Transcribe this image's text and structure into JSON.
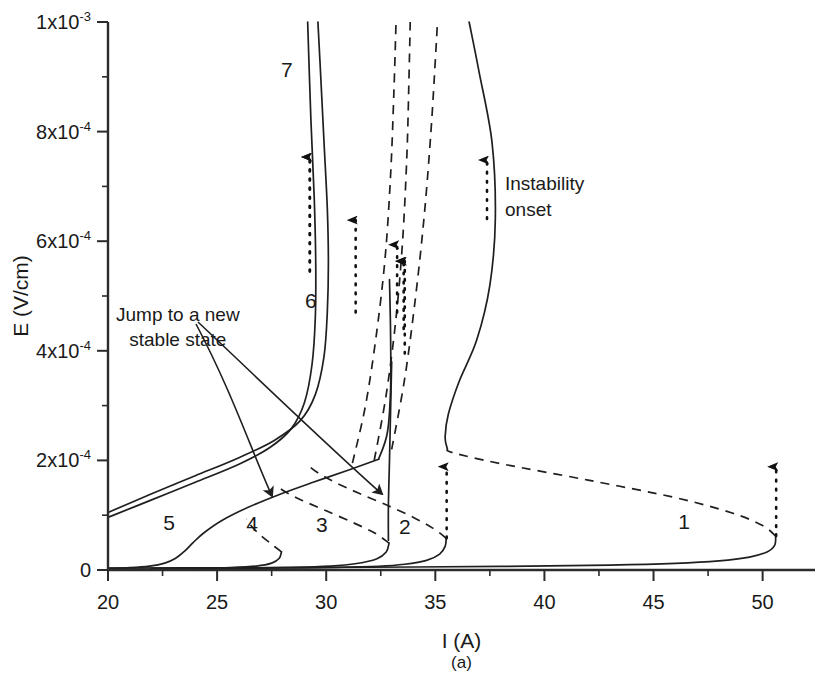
{
  "chart_data": {
    "type": "line",
    "title": "",
    "caption": "(a)",
    "xlabel": "I (A)",
    "ylabel": "E (V/cm)",
    "xlim": [
      20,
      52.4
    ],
    "ylim": [
      0,
      0.001
    ],
    "grid": false,
    "x_ticks": [
      {
        "value": 20,
        "label": "20"
      },
      {
        "value": 25,
        "label": "25"
      },
      {
        "value": 30,
        "label": "30"
      },
      {
        "value": 35,
        "label": "35"
      },
      {
        "value": 40,
        "label": "40"
      },
      {
        "value": 45,
        "label": "45"
      },
      {
        "value": 50,
        "label": "50"
      }
    ],
    "x_minor_ticks": [
      22.5,
      27.5,
      32.5,
      37.5,
      42.5,
      47.5
    ],
    "y_ticks": [
      {
        "value": 0.0,
        "mantissa": "0",
        "exponent": ""
      },
      {
        "value": 0.0002,
        "mantissa": "2x10",
        "exponent": "-4"
      },
      {
        "value": 0.0004,
        "mantissa": "4x10",
        "exponent": "-4"
      },
      {
        "value": 0.0006,
        "mantissa": "6x10",
        "exponent": "-4"
      },
      {
        "value": 0.0008,
        "mantissa": "8x10",
        "exponent": "-4"
      },
      {
        "value": 0.001,
        "mantissa": "1x10",
        "exponent": "-3"
      }
    ],
    "y_minor_ticks": [
      0.0001,
      0.0003,
      0.0005,
      0.0007,
      0.0009
    ],
    "legend": {
      "position": "inside-top-right",
      "entries": [
        {
          "marker": "dotted-up-arrow",
          "line1": "Instability",
          "line2": "onset"
        }
      ]
    },
    "annotations": [
      {
        "name": "jump-note",
        "line1": "Jump to a new",
        "line2": "stable state",
        "x": 23.2,
        "y": 0.000455
      }
    ],
    "curve_labels": [
      {
        "label": "7",
        "x": 28.2,
        "y": 0.0009
      },
      {
        "label": "6",
        "x": 29.3,
        "y": 0.000478
      },
      {
        "label": "5",
        "x": 22.8,
        "y": 7.35e-05
      },
      {
        "label": "4",
        "x": 26.6,
        "y": 7.05e-05
      },
      {
        "label": "3",
        "x": 29.8,
        "y": 6.9e-05
      },
      {
        "label": "2",
        "x": 33.6,
        "y": 6.6e-05
      },
      {
        "label": "1",
        "x": 46.4,
        "y": 7.4e-05
      }
    ],
    "series": [
      {
        "name": "1",
        "stable_branch": [
          [
            20.0,
            3.5e-06
          ],
          [
            26.0,
            4e-06
          ],
          [
            32.0,
            5e-06
          ],
          [
            38.0,
            6.5e-06
          ],
          [
            43.0,
            9e-06
          ],
          [
            46.0,
            1.2e-05
          ],
          [
            48.0,
            1.65e-05
          ],
          [
            49.4,
            2.35e-05
          ],
          [
            50.2,
            3.3e-05
          ],
          [
            50.55,
            4.5e-05
          ],
          [
            50.6,
            6.2e-05
          ]
        ],
        "unstable_branch": [
          [
            50.6,
            6.2e-05
          ],
          [
            50.0,
            8.1e-05
          ],
          [
            48.6,
            0.000104
          ],
          [
            46.0,
            0.000132
          ],
          [
            42.0,
            0.000164
          ],
          [
            38.0,
            0.000194
          ],
          [
            35.8,
            0.000214
          ],
          [
            35.55,
            0.000221
          ]
        ],
        "upper_branch": [
          [
            35.55,
            0.000221
          ],
          [
            35.45,
            0.000243
          ],
          [
            35.6,
            0.000285
          ],
          [
            36.1,
            0.000345
          ],
          [
            36.9,
            0.00042
          ],
          [
            37.5,
            0.00052
          ],
          [
            37.75,
            0.00064
          ],
          [
            37.6,
            0.00078
          ],
          [
            37.0,
            0.00091
          ],
          [
            36.55,
            0.001
          ]
        ],
        "instability_arrow": {
          "x": 50.62,
          "y_start": 6.2e-05,
          "y_end": 0.000205
        }
      },
      {
        "name": "2",
        "stable_branch": [
          [
            25.6,
            3e-06
          ],
          [
            28.0,
            3.7e-06
          ],
          [
            30.5,
            4.8e-06
          ],
          [
            32.4,
            6.8e-06
          ],
          [
            33.6,
            1.05e-05
          ],
          [
            34.6,
            1.75e-05
          ],
          [
            35.2,
            2.9e-05
          ],
          [
            35.45,
            4.3e-05
          ],
          [
            35.5,
            5.8e-05
          ]
        ],
        "unstable_branch": [
          [
            35.5,
            5.8e-05
          ],
          [
            34.9,
            7.6e-05
          ],
          [
            34.0,
            9.6e-05
          ],
          [
            32.8,
            0.000118
          ],
          [
            31.5,
            0.00014
          ],
          [
            30.4,
            0.00016
          ],
          [
            29.6,
            0.000178
          ],
          [
            29.2,
            0.00019
          ]
        ],
        "upper_branch": [
          [
            32.85,
            5.45e-05
          ],
          [
            32.85,
            0.000118
          ],
          [
            32.9,
            0.0002
          ],
          [
            32.95,
            0.00029
          ],
          [
            33.0,
            0.00038
          ]
        ],
        "instability_arrow": {
          "x": 35.52,
          "y_start": 5.8e-05,
          "y_end": 0.000205
        }
      },
      {
        "name": "3",
        "stable_branch": [
          [
            23.4,
            3e-06
          ],
          [
            26.0,
            3.6e-06
          ],
          [
            28.4,
            4.8e-06
          ],
          [
            30.2,
            7.2e-06
          ],
          [
            31.4,
            1.18e-05
          ],
          [
            32.3,
            2e-05
          ],
          [
            32.75,
            3.3e-05
          ],
          [
            32.88,
            4.9e-05
          ]
        ],
        "unstable_branch": [
          [
            32.88,
            4.9e-05
          ],
          [
            32.2,
            6.8e-05
          ],
          [
            31.2,
            8.7e-05
          ],
          [
            30.0,
            0.000108
          ],
          [
            28.9,
            0.000127
          ],
          [
            28.2,
            0.000141
          ],
          [
            27.85,
            0.00015
          ]
        ],
        "instability_arrow": {
          "x": 33.25,
          "y_start": 0.00047,
          "y_end": 0.00061
        }
      },
      {
        "name": "4",
        "stable_branch": [
          [
            22.0,
            2.8e-06
          ],
          [
            24.0,
            3.4e-06
          ],
          [
            25.6,
            4.6e-06
          ],
          [
            26.8,
            7.2e-06
          ],
          [
            27.5,
            1.25e-05
          ],
          [
            27.85,
            2.15e-05
          ],
          [
            27.95,
            3.3e-05
          ]
        ],
        "unstable_branch": [
          [
            27.95,
            3.3e-05
          ],
          [
            27.5,
            4.7e-05
          ],
          [
            27.0,
            6.3e-05
          ],
          [
            26.6,
            7.9e-05
          ],
          [
            26.35,
            9.3e-05
          ]
        ],
        "instability_arrow": {
          "x": 31.35,
          "y_start": 0.00047,
          "y_end": 0.000655
        }
      },
      {
        "name": "5",
        "stable_branch": [
          [
            20.0,
            3e-06
          ],
          [
            21.0,
            4.2e-06
          ],
          [
            21.9,
            7e-06
          ],
          [
            22.6,
            1.25e-05
          ],
          [
            23.1,
            2.15e-05
          ],
          [
            23.5,
            3.4e-05
          ],
          [
            23.9,
            5e-05
          ],
          [
            24.4,
            6.8e-05
          ],
          [
            25.2,
            9e-05
          ],
          [
            26.4,
            0.000114
          ],
          [
            27.8,
            0.000137
          ],
          [
            29.4,
            0.00016
          ],
          [
            31.0,
            0.000182
          ],
          [
            32.4,
            0.000202
          ]
        ],
        "upper_branch": [
          [
            32.4,
            0.000202
          ],
          [
            32.8,
            0.00025
          ],
          [
            32.95,
            0.00033
          ],
          [
            32.95,
            0.00043
          ],
          [
            32.9,
            0.00053
          ]
        ],
        "instability_arrow": {
          "x": 33.55,
          "y_start": 0.00044,
          "y_end": 0.00058
        }
      },
      {
        "name": "6",
        "stable_branch": [
          [
            20.0,
            0.000105
          ],
          [
            22.0,
            0.000139
          ],
          [
            24.0,
            0.000172
          ],
          [
            26.0,
            0.000205
          ],
          [
            27.6,
            0.000236
          ],
          [
            28.8,
            0.000272
          ],
          [
            29.5,
            0.00032
          ],
          [
            29.9,
            0.00039
          ],
          [
            30.05,
            0.00047
          ],
          [
            30.1,
            0.00056
          ],
          [
            30.05,
            0.00066
          ],
          [
            29.9,
            0.00078
          ],
          [
            29.75,
            0.0009
          ],
          [
            29.62,
            0.001
          ]
        ],
        "instability_arrow": {
          "x": 29.25,
          "y_start": 0.000545,
          "y_end": 0.00077
        }
      },
      {
        "name": "7",
        "stable_branch": [
          [
            20.0,
            9.6e-05
          ],
          [
            22.0,
            0.000128
          ],
          [
            24.0,
            0.00016
          ],
          [
            26.0,
            0.000193
          ],
          [
            27.4,
            0.000223
          ],
          [
            28.4,
            0.000258
          ],
          [
            29.0,
            0.000305
          ],
          [
            29.35,
            0.000375
          ],
          [
            29.5,
            0.00046
          ],
          [
            29.52,
            0.00056
          ],
          [
            29.45,
            0.00068
          ],
          [
            29.3,
            0.00082
          ],
          [
            29.15,
            0.001
          ]
        ],
        "instability_arrow": {
          "x": 29.25,
          "y_start": 0.000545,
          "y_end": 0.00077
        }
      },
      {
        "name": "dashed-rising-a",
        "dashed_only": [
          [
            31.2,
            0.000195
          ],
          [
            31.8,
            0.0003
          ],
          [
            32.3,
            0.00043
          ],
          [
            32.7,
            0.00057
          ],
          [
            32.95,
            0.00072
          ],
          [
            33.1,
            0.00087
          ],
          [
            33.2,
            0.001
          ]
        ]
      },
      {
        "name": "dashed-rising-b",
        "dashed_only": [
          [
            32.2,
            0.0002
          ],
          [
            32.75,
            0.00032
          ],
          [
            33.2,
            0.00046
          ],
          [
            33.5,
            0.0006
          ],
          [
            33.7,
            0.00076
          ],
          [
            33.8,
            0.00091
          ],
          [
            33.85,
            0.001
          ]
        ]
      },
      {
        "name": "dashed-rising-c",
        "dashed_only": [
          [
            33.0,
            0.00022
          ],
          [
            33.6,
            0.00035
          ],
          [
            34.1,
            0.0005
          ],
          [
            34.5,
            0.00065
          ],
          [
            34.8,
            0.0008
          ],
          [
            35.0,
            0.00093
          ],
          [
            35.1,
            0.001
          ]
        ]
      }
    ],
    "instability_arrows_extra": [
      {
        "name": "arrow-curve-3b",
        "x": 33.6,
        "y_start": 0.000395,
        "y_end": 0.00058
      }
    ]
  }
}
